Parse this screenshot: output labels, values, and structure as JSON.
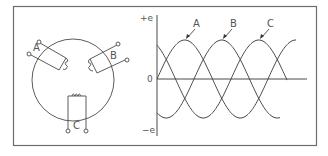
{
  "figure": {
    "colors": {
      "line": "#4a4a4a",
      "frame": "#6e6e6e",
      "text": "#555555",
      "background": "#ffffff"
    }
  },
  "generator": {
    "coils": [
      {
        "label": "A",
        "angle_deg": 135
      },
      {
        "label": "B",
        "angle_deg": 45
      },
      {
        "label": "C",
        "angle_deg": 270
      }
    ]
  },
  "chart_data": {
    "type": "line",
    "title": "",
    "xlabel": "",
    "ylabel": "",
    "y_tick_labels": [
      "+e",
      "0",
      "−e"
    ],
    "ylim": [
      -1,
      1
    ],
    "grid": false,
    "legend_position": "callout labels above peaks",
    "x_unit": "electrical degrees",
    "x": [
      0,
      30,
      60,
      90,
      120,
      150,
      180,
      210,
      240,
      270,
      300,
      330,
      360,
      390,
      420,
      450
    ],
    "series": [
      {
        "name": "A",
        "phase_deg": 0,
        "values": [
          0,
          0.5,
          0.87,
          1,
          0.87,
          0.5,
          0,
          -0.5,
          -0.87,
          -1,
          -0.87,
          -0.5,
          0,
          0.5,
          0.87,
          1
        ]
      },
      {
        "name": "B",
        "phase_deg": -120,
        "values": [
          -0.87,
          -0.5,
          0,
          0.5,
          0.87,
          1,
          0.87,
          0.5,
          0,
          -0.5,
          -0.87,
          -1,
          -0.87,
          -0.5,
          -0.0,
          null
        ]
      },
      {
        "name": "C",
        "phase_deg": -240,
        "values": [
          0.87,
          1,
          0.87,
          0.5,
          0,
          -0.5,
          -0.87,
          -1,
          -0.87,
          -0.5,
          0,
          0.5,
          0.87,
          1,
          0.87,
          null
        ]
      }
    ],
    "annotations": [
      {
        "text": "A",
        "points_to": "peak of A"
      },
      {
        "text": "B",
        "points_to": "peak of B"
      },
      {
        "text": "C",
        "points_to": "peak of C"
      }
    ]
  }
}
